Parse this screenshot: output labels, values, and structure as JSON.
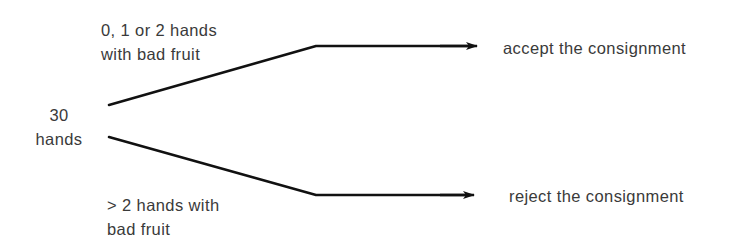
{
  "diagram": {
    "type": "decision-tree",
    "root": {
      "line1": "30",
      "line2": "hands"
    },
    "branches": [
      {
        "condition_line1": "0, 1 or 2 hands",
        "condition_line2": "with bad fruit",
        "outcome": "accept the consignment"
      },
      {
        "condition_line1": "> 2 hands with",
        "condition_line2": "bad fruit",
        "outcome": "reject the consignment"
      }
    ],
    "colors": {
      "line": "#111111",
      "text": "#3a3a3a",
      "background": "#ffffff"
    }
  }
}
